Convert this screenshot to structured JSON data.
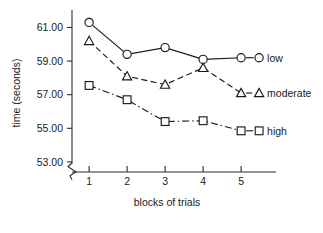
{
  "chart_data": {
    "type": "line",
    "title": "",
    "xlabel": "blocks of trials",
    "ylabel": "time (seconds)",
    "x": [
      1,
      2,
      3,
      4,
      5
    ],
    "xtick_labels": [
      "1",
      "2",
      "3",
      "4",
      "5"
    ],
    "ytick_labels": [
      "53.00",
      "55.00",
      "57.00",
      "59.00",
      "61.00"
    ],
    "ytick_values": [
      53.0,
      55.0,
      57.0,
      59.0,
      61.0
    ],
    "ylim": [
      52.4,
      61.8
    ],
    "xlim": [
      0.55,
      5.55
    ],
    "grid": false,
    "axis_break": true,
    "axis_break_note": "zigzag break on y-axis below 53.00",
    "legend_position": "right-inline",
    "series": [
      {
        "name": "low",
        "marker": "circle",
        "linestyle": "solid",
        "values": [
          61.3,
          59.4,
          59.8,
          59.1,
          59.2
        ]
      },
      {
        "name": "moderate",
        "marker": "triangle",
        "linestyle": "dashed",
        "values": [
          60.2,
          58.1,
          57.6,
          58.6,
          57.1
        ]
      },
      {
        "name": "high",
        "marker": "square",
        "linestyle": "dashdot",
        "values": [
          57.55,
          56.7,
          55.4,
          55.45,
          54.85
        ]
      }
    ]
  },
  "colors": {
    "ink": "#1a1a1a",
    "axis": "#2b2b2b",
    "background": "#ffffff",
    "marker_fill": "#ffffff"
  }
}
